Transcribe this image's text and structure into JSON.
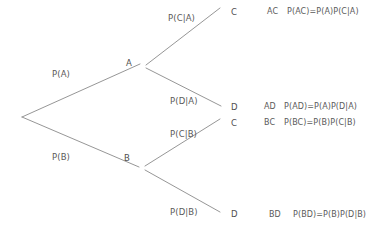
{
  "diagram": {
    "line_color": "#8a8a8a",
    "text_color": "#5a5a5a",
    "background": "#ffffff",
    "root": {
      "label": ""
    },
    "nodes": [
      {
        "id": "A",
        "label": "A"
      },
      {
        "id": "B",
        "label": "B"
      },
      {
        "id": "C1",
        "label": "C"
      },
      {
        "id": "D1",
        "label": "D"
      },
      {
        "id": "C2",
        "label": "C"
      },
      {
        "id": "D2",
        "label": "D"
      }
    ],
    "edges": [
      {
        "id": "root-A",
        "label": "P(A)"
      },
      {
        "id": "root-B",
        "label": "P(B)"
      },
      {
        "id": "A-C",
        "label": "P(C|A)"
      },
      {
        "id": "A-D",
        "label": "P(D|A)"
      },
      {
        "id": "B-C",
        "label": "P(C|B)"
      },
      {
        "id": "B-D",
        "label": "P(D|B)"
      }
    ],
    "outcomes": [
      {
        "id": "AC",
        "name": "AC",
        "expression": "P(AC)=P(A)P(C|A)"
      },
      {
        "id": "AD",
        "name": "AD",
        "expression": "P(AD)=P(A)P(D|A)"
      },
      {
        "id": "BC",
        "name": "BC",
        "expression": "P(BC)=P(B)P(C|B)"
      },
      {
        "id": "BD",
        "name": "BD",
        "expression": "P(BD)=P(B)P(D|B)"
      }
    ]
  }
}
